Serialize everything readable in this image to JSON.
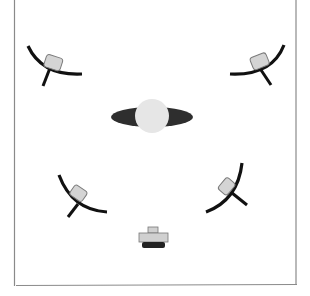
{
  "diagram": {
    "type": "lighting-setup-top-view",
    "title": "",
    "colors": {
      "background": "#ffffff",
      "frame": "#8a8a8a",
      "reflector": "#111111",
      "lamp_fill": "#d4d4d4",
      "lamp_stroke": "#7a7a7a",
      "subject_head": "#e6e6e6",
      "subject_shoulders": "#2e2e2e",
      "camera_body": "#d0d0d0",
      "camera_base": "#222222"
    },
    "elements": [
      {
        "id": "light-top-left",
        "kind": "light",
        "position": "upper-left"
      },
      {
        "id": "light-top-right",
        "kind": "light",
        "position": "upper-right"
      },
      {
        "id": "light-bottom-left",
        "kind": "light",
        "position": "lower-left"
      },
      {
        "id": "light-bottom-right",
        "kind": "light",
        "position": "lower-right"
      },
      {
        "id": "subject",
        "kind": "subject",
        "position": "center"
      },
      {
        "id": "camera",
        "kind": "camera",
        "position": "bottom-center"
      }
    ]
  }
}
